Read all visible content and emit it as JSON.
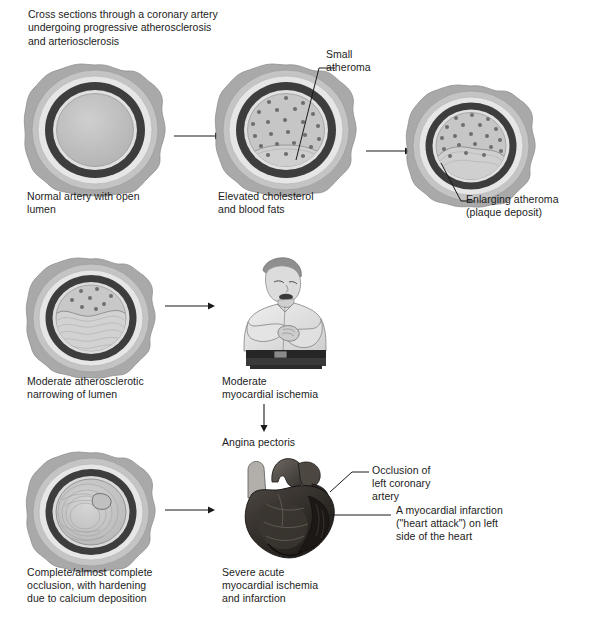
{
  "title": "Cross sections through a coronary artery\nundergoing progressive atherosclerosis\nand arteriosclerosis",
  "colors": {
    "adventitia_outer": "#a9a9a9",
    "adventitia_inner": "#c9c9c9",
    "ring_light": "#e4e4e4",
    "media_dark": "#3a3a3a",
    "intima": "#d8d8d8",
    "lumen": "#bfbfbf",
    "atheroma": "#c4c4c4",
    "dot": "#6e6e6e",
    "line": "#1a1a1a",
    "heart_dark": "#2b2724",
    "skin": "#d9d9d9",
    "shirt": "#e8e8e8",
    "trousers": "#2a2a2a"
  },
  "stages": [
    {
      "id": "stage-1",
      "name": "normal-artery",
      "caption": "Normal artery with open\nlumen",
      "dots": 0,
      "atheroma": "none"
    },
    {
      "id": "stage-2",
      "name": "elevated-cholesterol-artery",
      "caption": "Elevated cholesterol\nand blood fats",
      "dots": 24,
      "atheroma": "small",
      "callout": "Small\natheroma"
    },
    {
      "id": "stage-3",
      "name": "enlarging-atheroma-artery",
      "caption": "",
      "dots": 20,
      "atheroma": "medium",
      "callout": "Enlarging atheroma\n(plaque deposit)"
    },
    {
      "id": "stage-4",
      "name": "moderate-narrowing-artery",
      "caption": "Moderate atherosclerotic\nnarrowing of lumen",
      "dots": 8,
      "atheroma": "large"
    },
    {
      "id": "stage-5",
      "name": "complete-occlusion-artery",
      "caption": "Complete/almost complete\nocclusion, with hardening\ndue to calcium deposition",
      "dots": 0,
      "atheroma": "occluded"
    }
  ],
  "figures": {
    "man": {
      "name": "man-with-chest-pain",
      "caption": "Moderate\nmyocardial ischemia",
      "outcome": "Angina pectoris"
    },
    "heart": {
      "name": "heart-with-infarction",
      "caption": "Severe acute\nmyocardial ischemia\nand infarction",
      "callout_occlusion": "Occlusion of\nleft coronary\nartery",
      "callout_infarction": "A myocardial infarction\n(\"heart attack\") on left\nside of the heart"
    }
  }
}
